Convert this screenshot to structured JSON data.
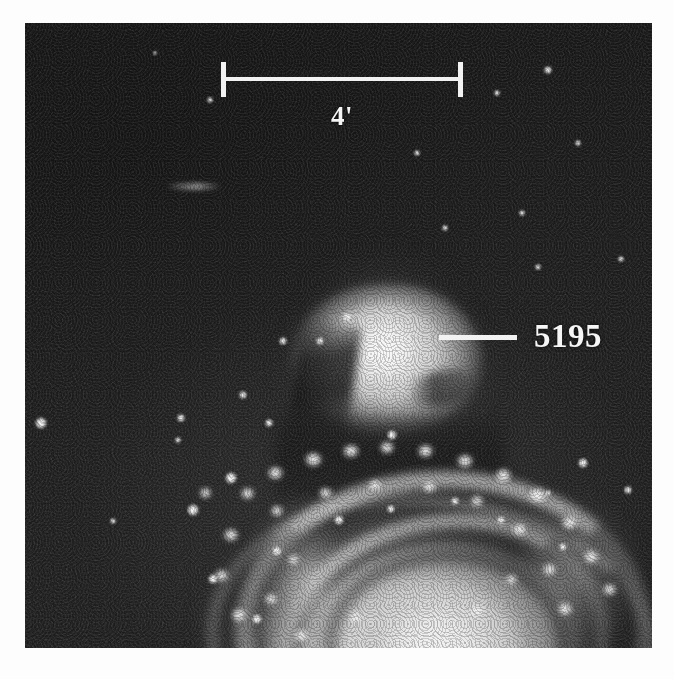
{
  "figure": {
    "kind": "astronomical-photograph",
    "background_color": "#1d1d1d",
    "page_color": "#fdfdfd",
    "annotation_color": "#f2f2f2"
  },
  "annotations": {
    "scale_bar": {
      "label": "4'",
      "meaning": "4 arcminutes",
      "bar_left_x": 196,
      "bar_right_x": 438,
      "bar_y": 54
    },
    "object_label": {
      "text": "5195",
      "pointer_from_x": 414,
      "pointer_to_x": 492,
      "pointer_y": 314
    }
  },
  "objects": {
    "companion": {
      "name": "5195",
      "center_x": 360,
      "center_y": 341
    },
    "spiral": {
      "name": "M51",
      "center_x": 410,
      "center_y": 620
    }
  },
  "stars": [
    {
      "x": 185,
      "y": 77,
      "r": 3
    },
    {
      "x": 472,
      "y": 70,
      "r": 3
    },
    {
      "x": 523,
      "y": 47,
      "r": 4
    },
    {
      "x": 392,
      "y": 130,
      "r": 3
    },
    {
      "x": 553,
      "y": 120,
      "r": 3
    },
    {
      "x": 16,
      "y": 400,
      "r": 6
    },
    {
      "x": 156,
      "y": 395,
      "r": 4
    },
    {
      "x": 153,
      "y": 417,
      "r": 3
    },
    {
      "x": 497,
      "y": 190,
      "r": 3
    },
    {
      "x": 513,
      "y": 244,
      "r": 3
    },
    {
      "x": 558,
      "y": 440,
      "r": 5
    },
    {
      "x": 523,
      "y": 470,
      "r": 3
    },
    {
      "x": 596,
      "y": 236,
      "r": 3
    },
    {
      "x": 603,
      "y": 467,
      "r": 4
    },
    {
      "x": 88,
      "y": 498,
      "r": 3
    },
    {
      "x": 218,
      "y": 372,
      "r": 4
    },
    {
      "x": 244,
      "y": 400,
      "r": 4
    },
    {
      "x": 295,
      "y": 318,
      "r": 4
    },
    {
      "x": 322,
      "y": 294,
      "r": 5
    },
    {
      "x": 367,
      "y": 412,
      "r": 5
    },
    {
      "x": 258,
      "y": 318,
      "r": 4
    },
    {
      "x": 206,
      "y": 455,
      "r": 6
    },
    {
      "x": 168,
      "y": 487,
      "r": 6
    },
    {
      "x": 252,
      "y": 528,
      "r": 5
    },
    {
      "x": 314,
      "y": 497,
      "r": 5
    },
    {
      "x": 366,
      "y": 486,
      "r": 4
    },
    {
      "x": 430,
      "y": 478,
      "r": 4
    },
    {
      "x": 476,
      "y": 497,
      "r": 4
    },
    {
      "x": 538,
      "y": 524,
      "r": 4
    },
    {
      "x": 188,
      "y": 556,
      "r": 5
    },
    {
      "x": 232,
      "y": 596,
      "r": 5
    },
    {
      "x": 130,
      "y": 30,
      "r": 2
    },
    {
      "x": 420,
      "y": 205,
      "r": 3
    }
  ],
  "knots": [
    {
      "x": 222,
      "y": 470,
      "w": 13,
      "h": 11
    },
    {
      "x": 250,
      "y": 450,
      "w": 15,
      "h": 12
    },
    {
      "x": 288,
      "y": 436,
      "w": 17,
      "h": 13
    },
    {
      "x": 326,
      "y": 428,
      "w": 16,
      "h": 12
    },
    {
      "x": 362,
      "y": 424,
      "w": 14,
      "h": 11
    },
    {
      "x": 400,
      "y": 428,
      "w": 15,
      "h": 12
    },
    {
      "x": 440,
      "y": 438,
      "w": 16,
      "h": 12
    },
    {
      "x": 478,
      "y": 452,
      "w": 15,
      "h": 13
    },
    {
      "x": 512,
      "y": 472,
      "w": 17,
      "h": 13
    },
    {
      "x": 544,
      "y": 500,
      "w": 15,
      "h": 12
    },
    {
      "x": 566,
      "y": 534,
      "w": 14,
      "h": 12
    },
    {
      "x": 206,
      "y": 512,
      "w": 14,
      "h": 12
    },
    {
      "x": 196,
      "y": 552,
      "w": 13,
      "h": 11
    },
    {
      "x": 214,
      "y": 592,
      "w": 14,
      "h": 12
    },
    {
      "x": 252,
      "y": 488,
      "w": 12,
      "h": 10
    },
    {
      "x": 300,
      "y": 470,
      "w": 13,
      "h": 10
    },
    {
      "x": 350,
      "y": 462,
      "w": 12,
      "h": 10
    },
    {
      "x": 404,
      "y": 464,
      "w": 13,
      "h": 10
    },
    {
      "x": 452,
      "y": 478,
      "w": 12,
      "h": 10
    },
    {
      "x": 494,
      "y": 506,
      "w": 13,
      "h": 11
    },
    {
      "x": 524,
      "y": 546,
      "w": 13,
      "h": 11
    },
    {
      "x": 540,
      "y": 586,
      "w": 14,
      "h": 12
    },
    {
      "x": 268,
      "y": 536,
      "w": 11,
      "h": 9
    },
    {
      "x": 246,
      "y": 576,
      "w": 12,
      "h": 10
    },
    {
      "x": 276,
      "y": 612,
      "w": 13,
      "h": 11
    },
    {
      "x": 330,
      "y": 594,
      "w": 11,
      "h": 9
    },
    {
      "x": 452,
      "y": 588,
      "w": 12,
      "h": 10
    },
    {
      "x": 486,
      "y": 556,
      "w": 11,
      "h": 9
    },
    {
      "x": 180,
      "y": 470,
      "w": 11,
      "h": 10
    },
    {
      "x": 584,
      "y": 566,
      "w": 13,
      "h": 11
    }
  ]
}
